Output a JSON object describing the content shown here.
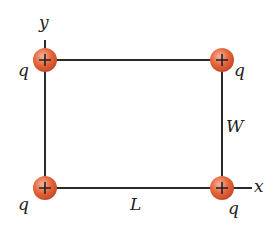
{
  "diagram": {
    "axes": {
      "x_label": "x",
      "y_label": "y"
    },
    "dimensions": {
      "length_label": "L",
      "width_label": "W"
    },
    "charges": [
      {
        "id": "top-left",
        "label": "q",
        "sign": "+"
      },
      {
        "id": "top-right",
        "label": "q",
        "sign": "+"
      },
      {
        "id": "bottom-left",
        "label": "q",
        "sign": "+"
      },
      {
        "id": "bottom-right",
        "label": "q",
        "sign": "+"
      }
    ],
    "colors": {
      "charge": "#e0603a",
      "line": "#2a2a2a"
    }
  }
}
